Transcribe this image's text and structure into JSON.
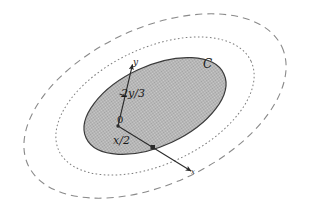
{
  "figure": {
    "background_color": "#ffffff",
    "labels": {
      "y_axis": "y",
      "y_intercept": "2y/3",
      "origin": "0",
      "x_intercept": "x/2",
      "x_axis": "x",
      "curve": "C"
    },
    "colors": {
      "shaded_fill": "#b5b5b5",
      "shaded_stroke": "#3a3a3a",
      "dotted_curve": "#7a7a7a",
      "dashed_curve": "#8a8a8a",
      "axis": "#2b2b2b",
      "label_text": "#1a1a1a"
    },
    "geometry": {
      "center_x": 155,
      "center_y": 106,
      "rotation_deg": -25,
      "inner_ellipse": {
        "rx": 76,
        "ry": 40,
        "style": "solid",
        "filled": true
      },
      "middle_ellipse": {
        "rx": 106,
        "ry": 58,
        "style": "dotted",
        "filled": false
      },
      "outer_ellipse": {
        "rx": 140,
        "ry": 78,
        "style": "dashed",
        "filled": false
      },
      "origin_point": {
        "x": 118,
        "y": 126
      },
      "y_axis_tip": {
        "x": 131,
        "y": 63
      },
      "y_tick": {
        "x": 123,
        "y": 95
      },
      "x_axis_tip": {
        "x": 192,
        "y": 172
      },
      "x_tick": {
        "x": 153,
        "y": 148
      }
    }
  }
}
